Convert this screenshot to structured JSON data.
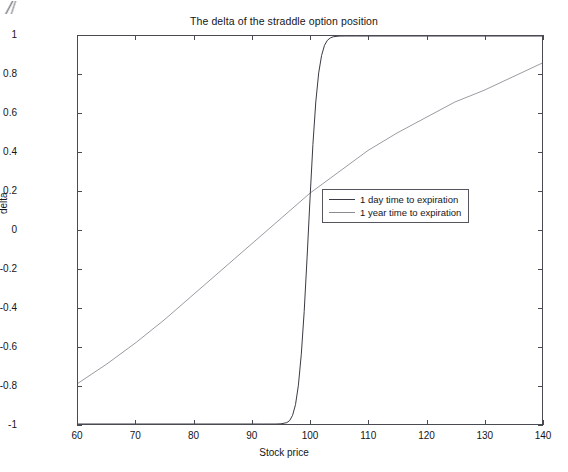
{
  "figure": {
    "title": "The delta of the straddle option position",
    "background": "#ffffff",
    "axis_color": "#4a4a52"
  },
  "chart_data": {
    "type": "line",
    "title": "The delta of the straddle option position",
    "xlabel": "Stock price",
    "ylabel": "delta",
    "xlim": [
      60,
      140
    ],
    "ylim": [
      -1,
      1
    ],
    "xticks": [
      60,
      70,
      80,
      90,
      100,
      110,
      120,
      130,
      140
    ],
    "xticklabels": [
      "60",
      "70",
      "80",
      "90",
      "100",
      "110",
      "120",
      "130",
      "140"
    ],
    "yticks": [
      -1,
      -0.8,
      -0.6,
      -0.4,
      -0.2,
      0,
      0.2,
      0.4,
      0.6,
      0.8,
      1
    ],
    "yticklabels": [
      "-1",
      "-0.8",
      "-0.6",
      "-0.4",
      "-0.2",
      "0",
      "0.2",
      "0.4",
      "0.6",
      "0.8",
      "1"
    ],
    "grid": false,
    "legend_position": "center",
    "series": [
      {
        "name": "1 day time to expiration",
        "color": "#3a3a44",
        "width": 1.0,
        "x": [
          60,
          70,
          80,
          85,
          90,
          92,
          94,
          95,
          96,
          96.5,
          97,
          97.5,
          98,
          98.5,
          99,
          99.5,
          100,
          100.5,
          101,
          101.5,
          102,
          102.5,
          103,
          103.5,
          104,
          105,
          106,
          108,
          110,
          115,
          120,
          130,
          140
        ],
        "y": [
          -1,
          -1,
          -1,
          -1,
          -1,
          -1,
          -1,
          -0.999,
          -0.993,
          -0.982,
          -0.955,
          -0.9,
          -0.8,
          -0.64,
          -0.42,
          -0.14,
          0.16,
          0.44,
          0.66,
          0.81,
          0.9,
          0.952,
          0.978,
          0.99,
          0.996,
          0.9995,
          1,
          1,
          1,
          1,
          1,
          1,
          1
        ]
      },
      {
        "name": "1 year time to expiration",
        "color": "#888892",
        "width": 0.85,
        "x": [
          60,
          65,
          70,
          75,
          80,
          85,
          90,
          95,
          100,
          105,
          110,
          115,
          120,
          125,
          130,
          135,
          140
        ],
        "y": [
          -0.79,
          -0.69,
          -0.58,
          -0.46,
          -0.33,
          -0.2,
          -0.07,
          0.06,
          0.19,
          0.3,
          0.41,
          0.5,
          0.58,
          0.66,
          0.72,
          0.79,
          0.86
        ]
      }
    ]
  },
  "legend": {
    "entries": [
      {
        "label": "1 day time to expiration",
        "color": "#3a3a44",
        "width": 1.0
      },
      {
        "label": "1 year time to expiration",
        "color": "#8b8b95",
        "width": 0.9
      }
    ]
  }
}
